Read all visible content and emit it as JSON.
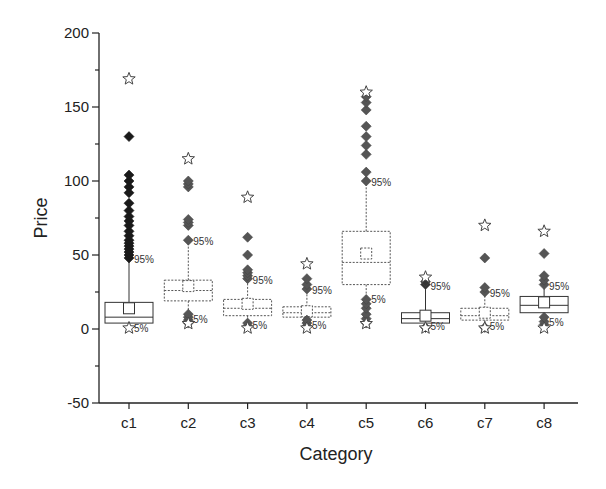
{
  "chart_data": {
    "type": "box",
    "title": "",
    "xlabel": "Category",
    "ylabel": "Price",
    "ylim": [
      -50,
      200
    ],
    "yticks": [
      -50,
      0,
      50,
      100,
      150,
      200
    ],
    "grid": false,
    "legend": null,
    "categories": [
      "c1",
      "c2",
      "c3",
      "c4",
      "c5",
      "c6",
      "c7",
      "c8"
    ],
    "annotations": {
      "upper": "95%",
      "lower": "5%"
    },
    "boxes": [
      {
        "category": "c1",
        "q1": 4,
        "median": 8,
        "q3": 18,
        "mean": 14,
        "p5": 1,
        "p95": 48,
        "max": 169,
        "min": 0,
        "line_style": "solid",
        "outlier_color": "#1a1a1a",
        "outliers_high": [
          48,
          50,
          52,
          54,
          56,
          58,
          60,
          63,
          66,
          70,
          73,
          76,
          80,
          85,
          92,
          96,
          100,
          104,
          130
        ]
      },
      {
        "category": "c2",
        "q1": 19,
        "median": 26,
        "q3": 33,
        "mean": 29,
        "p5": 7,
        "p95": 60,
        "max": 115,
        "min": 3,
        "line_style": "dashed",
        "outlier_color": "#555555",
        "outliers_high": [
          60,
          70,
          72,
          74,
          96,
          98,
          100
        ],
        "outliers_low": [
          4,
          6,
          8,
          10
        ]
      },
      {
        "category": "c3",
        "q1": 9,
        "median": 14,
        "q3": 20,
        "mean": 17,
        "p5": 3,
        "p95": 34,
        "max": 89,
        "min": 0,
        "line_style": "dashed",
        "outlier_color": "#555555",
        "outliers_high": [
          34,
          36,
          38,
          40,
          50,
          62
        ],
        "outliers_low": [
          2,
          4
        ]
      },
      {
        "category": "c4",
        "q1": 8,
        "median": 11,
        "q3": 15,
        "mean": 12,
        "p5": 3,
        "p95": 27,
        "max": 44,
        "min": 0,
        "line_style": "dashed",
        "outlier_color": "#555555",
        "outliers_high": [
          27,
          30,
          34
        ],
        "outliers_low": [
          2,
          4,
          6
        ]
      },
      {
        "category": "c5",
        "q1": 30,
        "median": 45,
        "q3": 66,
        "mean": 51,
        "p5": 20,
        "p95": 100,
        "max": 160,
        "min": 3,
        "line_style": "dashed",
        "outlier_color": "#555555",
        "outliers_high": [
          100,
          106,
          118,
          124,
          130,
          137,
          148,
          153,
          157
        ],
        "outliers_low": [
          4,
          7,
          10,
          14,
          17,
          20
        ]
      },
      {
        "category": "c6",
        "q1": 4,
        "median": 7,
        "q3": 11,
        "mean": 9,
        "p5": 2,
        "p95": 30,
        "max": 35,
        "min": 0,
        "line_style": "solid",
        "outlier_color": "#333333",
        "outliers_high": [
          30,
          32
        ],
        "outliers_low": [
          1
        ]
      },
      {
        "category": "c7",
        "q1": 6,
        "median": 9,
        "q3": 14,
        "mean": 11,
        "p5": 2,
        "p95": 25,
        "max": 70,
        "min": 0,
        "line_style": "dashed",
        "outlier_color": "#555555",
        "outliers_high": [
          25,
          28,
          48
        ],
        "outliers_low": [
          1
        ]
      },
      {
        "category": "c8",
        "q1": 11,
        "median": 16,
        "q3": 22,
        "mean": 18,
        "p5": 5,
        "p95": 30,
        "max": 66,
        "min": 0,
        "line_style": "solid",
        "outlier_color": "#555555",
        "outliers_high": [
          30,
          33,
          36,
          51
        ],
        "outliers_low": [
          3,
          5,
          8
        ]
      }
    ]
  }
}
